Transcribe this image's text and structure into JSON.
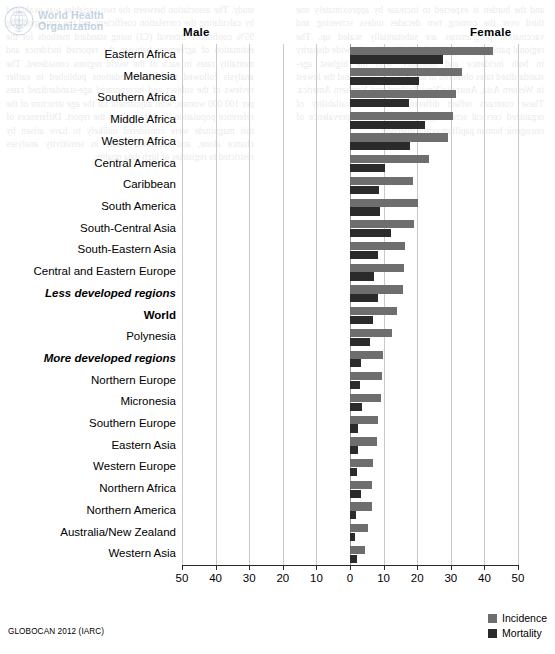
{
  "logo": {
    "emblem_name": "who-emblem-icon",
    "line1": "World Health",
    "line2": "Organization"
  },
  "source_note": "GLOBOCAN 2012 (IARC)",
  "legend": {
    "position": "bottom-right",
    "items": [
      {
        "label": "Incidence",
        "color": "#6e6e6e"
      },
      {
        "label": "Mortality",
        "color": "#2b2b2b"
      }
    ]
  },
  "headers": {
    "male": "Male",
    "female": "Female"
  },
  "background_text": {
    "left_column": "study. The association between the two variables was evaluated by calculating the correlation coefficient and the corresponding 95% confidence interval (CI) using standard methods for the estimation of agreement between the reported incidence and mortality rates in each of the world regions considered. The analysis followed the recommendations published in earlier reviews of the subject and incorporated age-standardized rates per 100 000 women, with adjustment for the age structure of the reference population used throughout the report. Differences of this magnitude were considered unlikely to have arisen by chance alone, and remained stable in sensitivity analyses restricted to registries of high data quality.",
    "right_column": "and the burden is expected to increase by approximately one third over the coming two decades unless screening and vaccination programmes are substantially scaled up. The regional pattern shown in the figure illustrates the wide disparity in both incidence and mortality, with the highest age-standardized rates observed in sub-Saharan Africa and the lowest in Western Asia, Australia/New Zealand and Northern America. These contrasts reflect differences in the availability of organized cervical screening as well as in the prevalence of oncogenic human papillomavirus infection."
  },
  "chart_data": {
    "type": "bar",
    "orientation": "horizontal",
    "title": "",
    "subtitle": "",
    "xlabel": "",
    "ylabel": "",
    "xlim": [
      -50,
      50
    ],
    "xticks": [
      -50,
      -40,
      -30,
      -20,
      -10,
      0,
      10,
      20,
      30,
      40,
      50
    ],
    "xticklabels": [
      "50",
      "40",
      "30",
      "20",
      "10",
      "0",
      "10",
      "20",
      "30",
      "40",
      "50"
    ],
    "grid": "vertical",
    "legend_position": "bottom-right",
    "note": "Sex-specific (female-only) cancer: all bars plotted on the Female (right) side; Male side is empty.",
    "categories": [
      "Eastern Africa",
      "Melanesia",
      "Southern Africa",
      "Middle Africa",
      "Western Africa",
      "Central America",
      "Caribbean",
      "South America",
      "South-Central Asia",
      "South-Eastern Asia",
      "Central and Eastern Europe",
      "Less developed regions",
      "World",
      "Polynesia",
      "More developed regions",
      "Northern Europe",
      "Micronesia",
      "Southern Europe",
      "Eastern Asia",
      "Western Europe",
      "Northern Africa",
      "Northern America",
      "Australia/New Zealand",
      "Western Asia"
    ],
    "category_styles": [
      "normal",
      "normal",
      "normal",
      "normal",
      "normal",
      "normal",
      "normal",
      "normal",
      "normal",
      "normal",
      "normal",
      "emph",
      "strong",
      "normal",
      "emph",
      "normal",
      "normal",
      "normal",
      "normal",
      "normal",
      "normal",
      "normal",
      "normal",
      "normal"
    ],
    "series": [
      {
        "name": "Incidence",
        "side": "female",
        "color": "#6e6e6e",
        "values": [
          42.7,
          33.3,
          31.5,
          30.6,
          29.3,
          23.5,
          18.7,
          20.3,
          19.0,
          16.3,
          16.2,
          15.7,
          14.0,
          12.6,
          9.9,
          9.4,
          9.2,
          8.2,
          7.9,
          6.9,
          6.6,
          6.6,
          5.5,
          4.4
        ]
      },
      {
        "name": "Mortality",
        "side": "female",
        "color": "#2b2b2b",
        "values": [
          27.6,
          20.6,
          17.5,
          22.2,
          18.0,
          10.3,
          8.6,
          8.8,
          12.1,
          8.2,
          7.1,
          8.3,
          6.8,
          6.0,
          3.3,
          2.9,
          3.7,
          2.4,
          2.3,
          2.0,
          3.3,
          1.9,
          1.4,
          2.0
        ]
      }
    ]
  }
}
